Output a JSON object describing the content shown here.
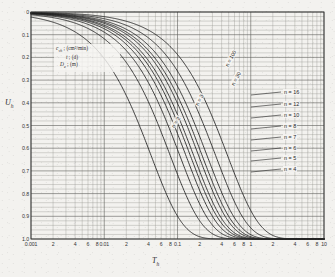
{
  "figure": {
    "background_color": "#f3f2ef",
    "ink_color": "#2b2b2b",
    "grid_color": "#7b7b76"
  },
  "axes": {
    "x_label": "T",
    "x_label_sub": "h",
    "y_label": "U",
    "y_label_sub": "h",
    "x_scale": "log",
    "y_scale": "linear",
    "x_min": 0.001,
    "x_max": 10,
    "y_min": 0,
    "y_max": 1.0,
    "y_inverted": true,
    "x_ticks": [
      {
        "value": 0.001,
        "label": "0.001"
      },
      {
        "value": 0.002,
        "label": "2"
      },
      {
        "value": 0.004,
        "label": "4"
      },
      {
        "value": 0.006,
        "label": "6"
      },
      {
        "value": 0.008,
        "label": "8"
      },
      {
        "value": 0.01,
        "label": "0.01"
      },
      {
        "value": 0.02,
        "label": "2"
      },
      {
        "value": 0.04,
        "label": "4"
      },
      {
        "value": 0.06,
        "label": "6"
      },
      {
        "value": 0.08,
        "label": "8"
      },
      {
        "value": 0.1,
        "label": "0.1"
      },
      {
        "value": 0.2,
        "label": "2"
      },
      {
        "value": 0.4,
        "label": "4"
      },
      {
        "value": 0.6,
        "label": "6"
      },
      {
        "value": 0.8,
        "label": "8"
      },
      {
        "value": 1,
        "label": "1"
      },
      {
        "value": 2,
        "label": "2"
      },
      {
        "value": 4,
        "label": "4"
      },
      {
        "value": 6,
        "label": "6"
      },
      {
        "value": 8,
        "label": "8"
      },
      {
        "value": 10,
        "label": "10"
      }
    ],
    "y_ticks": [
      {
        "value": 0.0,
        "label": "0"
      },
      {
        "value": 0.1,
        "label": "0.1"
      },
      {
        "value": 0.2,
        "label": "0.2"
      },
      {
        "value": 0.3,
        "label": "0.3"
      },
      {
        "value": 0.4,
        "label": "0.4"
      },
      {
        "value": 0.5,
        "label": "0.5"
      },
      {
        "value": 0.6,
        "label": "0.6"
      },
      {
        "value": 0.7,
        "label": "0.7"
      },
      {
        "value": 0.8,
        "label": "0.8"
      },
      {
        "value": 0.9,
        "label": "0.9"
      },
      {
        "value": 1.0,
        "label": "1.0"
      }
    ]
  },
  "legend": {
    "line1_sym": "c",
    "line1_sub": "vh",
    "line1_units": "(cm²/min)",
    "line2_sym": "t",
    "line2_units": "(d)",
    "line3_sym": "D",
    "line3_sub": "e",
    "line3_units": "(m)",
    "sep": " ; "
  },
  "curve_labels": [
    {
      "text": "n = 2",
      "x": 172,
      "y": 125,
      "rot": -58
    },
    {
      "text": "n = 3",
      "x": 196,
      "y": 103,
      "rot": -62
    },
    {
      "text": "n = 30",
      "x": 232,
      "y": 83,
      "rot": -62
    },
    {
      "text": "n = 100",
      "x": 226,
      "y": 64,
      "rot": -62
    },
    {
      "text": "n = 16",
      "x": 283,
      "y": 89
    },
    {
      "text": "n = 12",
      "x": 283,
      "y": 101
    },
    {
      "text": "n = 10",
      "x": 283,
      "y": 112
    },
    {
      "text": "n = 8",
      "x": 283,
      "y": 123
    },
    {
      "text": "n = 7",
      "x": 283,
      "y": 134
    },
    {
      "text": "n = 6",
      "x": 283,
      "y": 145
    },
    {
      "text": "n = 5",
      "x": 283,
      "y": 155
    },
    {
      "text": "n = 4",
      "x": 283,
      "y": 166
    }
  ],
  "chart_data": {
    "type": "line",
    "title": "",
    "xlabel": "T_h",
    "ylabel": "U_h",
    "xscale": "log",
    "xlim": [
      0.001,
      10
    ],
    "ylim": [
      0,
      1.0
    ],
    "y_inverted": true,
    "grid": true,
    "legend_position": "right-inline",
    "note": "Values of U_h are computed from U_h = 1 - exp(-8*T_h/F(n)), F(n)= ln(n)-3/4 (approx.), sampled at the T_h values listed in x.",
    "x": [
      0.001,
      0.002,
      0.004,
      0.006,
      0.008,
      0.01,
      0.02,
      0.04,
      0.06,
      0.08,
      0.1,
      0.2,
      0.4,
      0.6,
      0.8,
      1.0,
      2.0,
      4.0,
      6.0,
      8.0,
      10.0
    ],
    "series": [
      {
        "name": "n = 2",
        "n": 2,
        "values": [
          0.047,
          0.092,
          0.175,
          0.251,
          0.32,
          0.384,
          0.62,
          0.856,
          0.945,
          0.979,
          0.992,
          1.0,
          1.0,
          1.0,
          1.0,
          1.0,
          1.0,
          1.0,
          1.0,
          1.0,
          1.0
        ]
      },
      {
        "name": "n = 3",
        "n": 3,
        "values": [
          0.024,
          0.048,
          0.094,
          0.137,
          0.179,
          0.219,
          0.39,
          0.628,
          0.773,
          0.862,
          0.916,
          0.993,
          1.0,
          1.0,
          1.0,
          1.0,
          1.0,
          1.0,
          1.0,
          1.0,
          1.0
        ]
      },
      {
        "name": "n = 4",
        "n": 4,
        "values": [
          0.018,
          0.035,
          0.069,
          0.102,
          0.134,
          0.165,
          0.302,
          0.513,
          0.66,
          0.763,
          0.835,
          0.973,
          0.999,
          1.0,
          1.0,
          1.0,
          1.0,
          1.0,
          1.0,
          1.0,
          1.0
        ]
      },
      {
        "name": "n = 5",
        "n": 5,
        "values": [
          0.014,
          0.029,
          0.057,
          0.084,
          0.111,
          0.137,
          0.255,
          0.445,
          0.586,
          0.692,
          0.771,
          0.947,
          0.997,
          1.0,
          1.0,
          1.0,
          1.0,
          1.0,
          1.0,
          1.0,
          1.0
        ]
      },
      {
        "name": "n = 6",
        "n": 6,
        "values": [
          0.013,
          0.025,
          0.05,
          0.073,
          0.097,
          0.12,
          0.225,
          0.399,
          0.533,
          0.639,
          0.721,
          0.922,
          0.994,
          1.0,
          1.0,
          1.0,
          1.0,
          1.0,
          1.0,
          1.0,
          1.0
        ]
      },
      {
        "name": "n = 7",
        "n": 7,
        "values": [
          0.011,
          0.022,
          0.044,
          0.066,
          0.087,
          0.108,
          0.203,
          0.365,
          0.493,
          0.596,
          0.679,
          0.897,
          0.989,
          0.999,
          1.0,
          1.0,
          1.0,
          1.0,
          1.0,
          1.0,
          1.0
        ]
      },
      {
        "name": "n = 8",
        "n": 8,
        "values": [
          0.01,
          0.02,
          0.04,
          0.06,
          0.079,
          0.098,
          0.187,
          0.338,
          0.461,
          0.561,
          0.643,
          0.873,
          0.984,
          0.998,
          1.0,
          1.0,
          1.0,
          1.0,
          1.0,
          1.0,
          1.0
        ]
      },
      {
        "name": "n = 10",
        "n": 10,
        "values": [
          0.009,
          0.018,
          0.035,
          0.052,
          0.069,
          0.086,
          0.164,
          0.301,
          0.415,
          0.51,
          0.591,
          0.833,
          0.972,
          0.995,
          0.999,
          1.0,
          1.0,
          1.0,
          1.0,
          1.0,
          1.0
        ]
      },
      {
        "name": "n = 12",
        "n": 12,
        "values": [
          0.008,
          0.016,
          0.032,
          0.047,
          0.062,
          0.077,
          0.148,
          0.274,
          0.381,
          0.471,
          0.551,
          0.798,
          0.959,
          0.992,
          0.998,
          1.0,
          1.0,
          1.0,
          1.0,
          1.0,
          1.0
        ]
      },
      {
        "name": "n = 16",
        "n": 16,
        "values": [
          0.007,
          0.014,
          0.027,
          0.041,
          0.054,
          0.067,
          0.129,
          0.241,
          0.339,
          0.423,
          0.498,
          0.748,
          0.937,
          0.984,
          0.996,
          0.999,
          1.0,
          1.0,
          1.0,
          1.0,
          1.0
        ]
      },
      {
        "name": "n = 30",
        "n": 30,
        "values": [
          0.005,
          0.01,
          0.021,
          0.031,
          0.041,
          0.051,
          0.099,
          0.188,
          0.268,
          0.34,
          0.405,
          0.646,
          0.875,
          0.956,
          0.984,
          0.994,
          1.0,
          1.0,
          1.0,
          1.0,
          1.0
        ]
      },
      {
        "name": "n = 100",
        "n": 100,
        "values": [
          0.004,
          0.007,
          0.014,
          0.021,
          0.028,
          0.035,
          0.069,
          0.133,
          0.193,
          0.249,
          0.301,
          0.512,
          0.762,
          0.884,
          0.943,
          0.972,
          0.999,
          1.0,
          1.0,
          1.0,
          1.0
        ]
      }
    ]
  }
}
